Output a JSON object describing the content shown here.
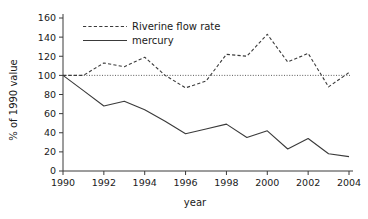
{
  "chart_data": {
    "type": "line",
    "title": "",
    "xlabel": "year",
    "ylabel": "% of 1990 value",
    "x": [
      1990,
      1991,
      1992,
      1993,
      1994,
      1995,
      1996,
      1997,
      1998,
      1999,
      2000,
      2001,
      2002,
      2003,
      2004
    ],
    "xlim": [
      1990,
      2004
    ],
    "ylim": [
      0,
      160
    ],
    "xticks": [
      1990,
      1992,
      1994,
      1996,
      1998,
      2000,
      2002,
      2004
    ],
    "xticklabels": [
      "1990",
      "1992",
      "1994",
      "1996",
      "1998",
      "2000",
      "2002",
      "2004"
    ],
    "yticks": [
      0,
      20,
      40,
      60,
      80,
      100,
      120,
      140,
      160
    ],
    "yticklabels": [
      "0",
      "20",
      "40",
      "60",
      "80",
      "100",
      "120",
      "140",
      "160"
    ],
    "grid": false,
    "legend_position": "upper-left",
    "reference_line": {
      "y": 100,
      "style": "dotted"
    },
    "series": [
      {
        "name": "Riverine flow rate",
        "style": "dashed",
        "color": "#3a3a3a",
        "values": [
          100,
          100,
          113,
          109,
          119,
          100,
          87,
          94,
          122,
          120,
          143,
          114,
          123,
          88,
          103
        ]
      },
      {
        "name": "mercury",
        "style": "solid",
        "color": "#3a3a3a",
        "values": [
          100,
          84,
          68,
          73,
          64,
          52,
          39,
          44,
          49,
          35,
          42,
          23,
          34,
          18,
          15
        ]
      }
    ]
  },
  "legend": {
    "items": [
      {
        "label": "Riverine flow rate",
        "style": "dashed"
      },
      {
        "label": "mercury",
        "style": "solid"
      }
    ]
  }
}
